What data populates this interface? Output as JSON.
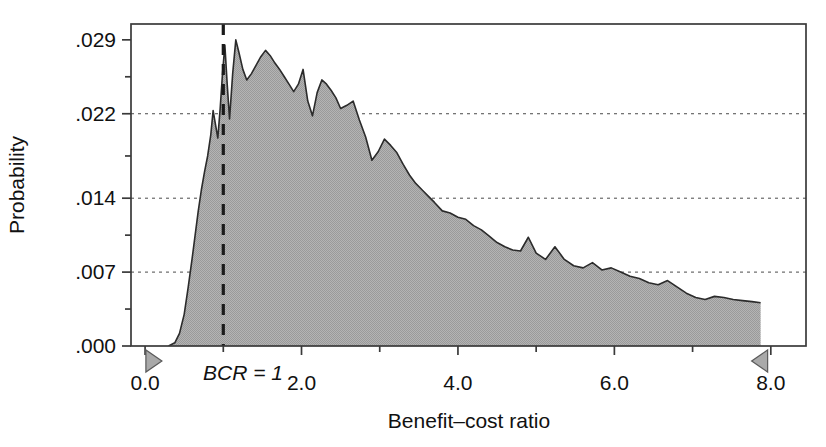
{
  "chart_data": {
    "type": "area",
    "title": "",
    "xlabel": "Benefit–cost ratio",
    "ylabel": "Probability",
    "xlim": [
      -0.18,
      8.45
    ],
    "ylim": [
      0.0,
      0.0305
    ],
    "grid": "horizontal-dotted",
    "legend": "none",
    "fill_color": "#a9a9a9",
    "line_color": "#1a1a1a",
    "xticks_major": [
      0.0,
      2.0,
      4.0,
      6.0,
      8.0
    ],
    "xtick_labels": [
      "0.0",
      "2.0",
      "4.0",
      "6.0",
      "8.0"
    ],
    "xticks_minor": [
      1.0,
      3.0,
      5.0,
      7.0
    ],
    "yticks_major": [
      0.0,
      0.007,
      0.014,
      0.022,
      0.029
    ],
    "ytick_labels": [
      ".000",
      ".007",
      ".014",
      ".022",
      ".029"
    ],
    "yticks_minor": [
      0.0035,
      0.0105,
      0.018,
      0.0255
    ],
    "gridlines_at": [
      0.007,
      0.014,
      0.022
    ],
    "annotations": [
      {
        "name": "bcr-reference-line",
        "label": "BCR = 1",
        "x": 1.0,
        "style": "dashed-vertical",
        "color": "#1a1a1a"
      },
      {
        "name": "lower-bound-marker",
        "label": "",
        "x": 0.1,
        "shape": "triangle-right",
        "color": "#a9a9a9"
      },
      {
        "name": "upper-bound-marker",
        "label": "",
        "x": 7.87,
        "shape": "triangle-left",
        "color": "#a9a9a9"
      }
    ],
    "x": [
      0.3,
      0.38,
      0.44,
      0.5,
      0.55,
      0.6,
      0.64,
      0.68,
      0.72,
      0.76,
      0.8,
      0.84,
      0.87,
      0.9,
      0.93,
      0.96,
      0.99,
      1.02,
      1.05,
      1.08,
      1.12,
      1.16,
      1.2,
      1.25,
      1.3,
      1.36,
      1.42,
      1.48,
      1.54,
      1.6,
      1.66,
      1.72,
      1.78,
      1.84,
      1.9,
      1.96,
      2.02,
      2.08,
      2.14,
      2.2,
      2.26,
      2.32,
      2.38,
      2.44,
      2.5,
      2.58,
      2.66,
      2.74,
      2.82,
      2.9,
      2.98,
      3.06,
      3.14,
      3.22,
      3.3,
      3.38,
      3.46,
      3.54,
      3.62,
      3.7,
      3.8,
      3.9,
      4.0,
      4.1,
      4.2,
      4.3,
      4.4,
      4.5,
      4.6,
      4.7,
      4.8,
      4.9,
      5.0,
      5.12,
      5.24,
      5.36,
      5.48,
      5.6,
      5.72,
      5.84,
      5.96,
      6.08,
      6.2,
      6.32,
      6.44,
      6.56,
      6.68,
      6.8,
      6.92,
      7.04,
      7.16,
      7.28,
      7.4,
      7.52,
      7.64,
      7.76,
      7.87
    ],
    "y": [
      0.0,
      0.0003,
      0.0012,
      0.003,
      0.0055,
      0.0082,
      0.0105,
      0.0128,
      0.0148,
      0.0165,
      0.018,
      0.02,
      0.0223,
      0.021,
      0.0197,
      0.0225,
      0.0258,
      0.0285,
      0.0248,
      0.0215,
      0.0258,
      0.029,
      0.0278,
      0.0262,
      0.0252,
      0.0258,
      0.0266,
      0.0274,
      0.028,
      0.0275,
      0.0268,
      0.0262,
      0.0255,
      0.0248,
      0.0241,
      0.0248,
      0.0262,
      0.0232,
      0.0218,
      0.024,
      0.0252,
      0.0248,
      0.0242,
      0.0235,
      0.0225,
      0.0228,
      0.0232,
      0.0214,
      0.0198,
      0.0176,
      0.0184,
      0.0196,
      0.019,
      0.0183,
      0.0172,
      0.0162,
      0.0154,
      0.0148,
      0.0142,
      0.0136,
      0.0128,
      0.0126,
      0.0122,
      0.012,
      0.0114,
      0.011,
      0.0104,
      0.0098,
      0.0094,
      0.0091,
      0.009,
      0.0103,
      0.0088,
      0.0082,
      0.0094,
      0.0082,
      0.0076,
      0.0074,
      0.0079,
      0.0072,
      0.0074,
      0.007,
      0.0066,
      0.0064,
      0.006,
      0.0058,
      0.0062,
      0.0056,
      0.005,
      0.0046,
      0.0044,
      0.0047,
      0.0046,
      0.0044,
      0.0043,
      0.0042,
      0.0041,
      0.004,
      0.0
    ]
  }
}
